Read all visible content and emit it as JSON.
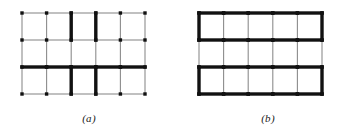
{
  "figure": {
    "width": 357,
    "height": 135,
    "background_color": "#ffffff",
    "thin_edge_color": "#8c8c8c",
    "bold_edge_color": "#111111",
    "node_color": "#111111",
    "thin_edge_width": 1.1,
    "bold_edge_width": 3.4,
    "node_size": 3.4
  },
  "panels": [
    {
      "id": "a",
      "caption": "(a)",
      "origin_x": 22,
      "origin_y": 13,
      "cell_width": 24.6,
      "cell_height": 27.0,
      "columns": 5,
      "rows": 3,
      "node_columns": 6,
      "node_rows": 4,
      "bold_vertical_edges": [
        {
          "col": 2,
          "row": 0
        },
        {
          "col": 3,
          "row": 0
        },
        {
          "col": 2,
          "row": 2
        },
        {
          "col": 3,
          "row": 2
        }
      ],
      "bold_horizontal_edges": [
        {
          "col": 0,
          "row": 2
        },
        {
          "col": 1,
          "row": 2
        },
        {
          "col": 2,
          "row": 2
        },
        {
          "col": 3,
          "row": 2
        },
        {
          "col": 4,
          "row": 2
        }
      ]
    },
    {
      "id": "b",
      "caption": "(b)",
      "origin_x": 20,
      "origin_y": 13,
      "cell_width": 24.6,
      "cell_height": 27.0,
      "columns": 5,
      "rows": 3,
      "node_columns": 6,
      "node_rows": 4,
      "bold_vertical_edges": [
        {
          "col": 0,
          "row": 0
        },
        {
          "col": 5,
          "row": 0
        },
        {
          "col": 0,
          "row": 2
        },
        {
          "col": 5,
          "row": 2
        }
      ],
      "bold_horizontal_edges": [
        {
          "col": 0,
          "row": 0
        },
        {
          "col": 1,
          "row": 0
        },
        {
          "col": 2,
          "row": 0
        },
        {
          "col": 3,
          "row": 0
        },
        {
          "col": 4,
          "row": 0
        },
        {
          "col": 0,
          "row": 1
        },
        {
          "col": 1,
          "row": 1
        },
        {
          "col": 2,
          "row": 1
        },
        {
          "col": 3,
          "row": 1
        },
        {
          "col": 4,
          "row": 1
        },
        {
          "col": 0,
          "row": 2
        },
        {
          "col": 1,
          "row": 2
        },
        {
          "col": 2,
          "row": 2
        },
        {
          "col": 3,
          "row": 2
        },
        {
          "col": 4,
          "row": 2
        },
        {
          "col": 0,
          "row": 3
        },
        {
          "col": 1,
          "row": 3
        },
        {
          "col": 2,
          "row": 3
        },
        {
          "col": 3,
          "row": 3
        },
        {
          "col": 4,
          "row": 3
        }
      ]
    }
  ],
  "caption_y": 112
}
